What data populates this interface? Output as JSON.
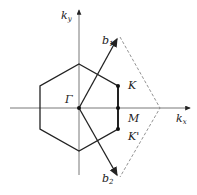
{
  "diagram": {
    "axes": {
      "x_label": "k",
      "x_sub": "x",
      "y_label": "k",
      "y_sub": "y"
    },
    "points": {
      "gamma": "Γ",
      "K": "K",
      "M": "M",
      "K_prime": "K'"
    },
    "vectors": {
      "b1_label": "b",
      "b1_sub": "1",
      "b2_label": "b",
      "b2_sub": "2"
    },
    "colors": {
      "line": "#222222",
      "axis": "#555555",
      "dashed": "#777777"
    }
  }
}
